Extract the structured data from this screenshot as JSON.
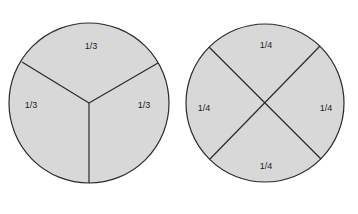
{
  "diagram": {
    "title": "",
    "colors": {
      "fill": "#d8d8d8",
      "stroke": "#2a2a2a"
    },
    "circles": [
      {
        "name": "thirds",
        "labels": [
          "1/3",
          "1/3",
          "1/3"
        ]
      },
      {
        "name": "quarters",
        "labels": [
          "1/4",
          "1/4",
          "1/4",
          "1/4"
        ]
      }
    ]
  }
}
